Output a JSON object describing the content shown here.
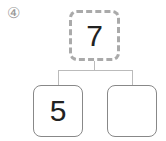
{
  "problem": {
    "number_label": "④"
  },
  "number_bond": {
    "whole": "7",
    "part_left": "5",
    "part_right": ""
  }
}
